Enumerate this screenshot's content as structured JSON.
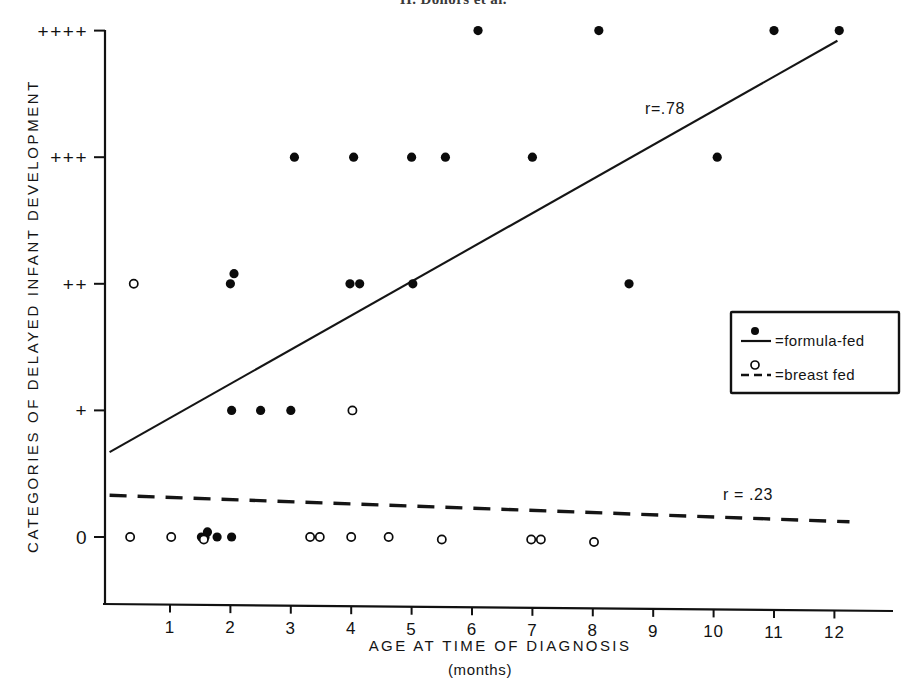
{
  "figure": {
    "caption": "H. Donors et al."
  },
  "axes": {
    "x_title": "AGE AT TIME OF DIAGNOSIS",
    "x_subtitle": "(months)",
    "y_title": "CATEGORIES OF DELAYED INFANT DEVELOPMENT"
  },
  "legend": {
    "formula_label": "=formula-fed",
    "breast_label": "=breast fed",
    "formula_marker": "filled-circle-icon",
    "breast_marker": "open-circle-icon",
    "formula_line": "solid-line-icon",
    "breast_line": "dashed-line-icon"
  },
  "annotations": {
    "r_formula": "r=.78",
    "r_breast": "r = .23"
  },
  "chart_data": {
    "type": "scatter",
    "title": "",
    "xlabel": "AGE AT TIME OF DIAGNOSIS (months)",
    "ylabel": "CATEGORIES OF DELAYED INFANT DEVELOPMENT",
    "xlim": [
      0,
      12.4
    ],
    "ylim": [
      0,
      4
    ],
    "grid": false,
    "legend_position": "right-middle",
    "xticks": [
      1,
      2,
      3,
      4,
      5,
      6,
      7,
      8,
      9,
      10,
      11,
      12
    ],
    "xticklabels": [
      "1",
      "2",
      "3",
      "4",
      "5",
      "6",
      "7",
      "8",
      "9",
      "10",
      "11",
      "12"
    ],
    "yticks": [
      0,
      1,
      2,
      3,
      4
    ],
    "yticklabels": [
      "0",
      "+",
      "++",
      "+++",
      "++++"
    ],
    "series": [
      {
        "name": "=formula-fed",
        "marker": "filled-circle",
        "points": [
          [
            1.52,
            0
          ],
          [
            1.58,
            0
          ],
          [
            1.62,
            0.04
          ],
          [
            1.78,
            0
          ],
          [
            2.02,
            0
          ],
          [
            2.02,
            1
          ],
          [
            2.5,
            1
          ],
          [
            3.0,
            1
          ],
          [
            2.0,
            2
          ],
          [
            2.06,
            2.08
          ],
          [
            3.98,
            2
          ],
          [
            4.14,
            2
          ],
          [
            5.02,
            2
          ],
          [
            8.6,
            2
          ],
          [
            3.06,
            3
          ],
          [
            4.04,
            3
          ],
          [
            5.0,
            3
          ],
          [
            5.56,
            3
          ],
          [
            7.0,
            3
          ],
          [
            10.06,
            3
          ],
          [
            6.1,
            4
          ],
          [
            8.1,
            4
          ],
          [
            11.0,
            4
          ],
          [
            12.08,
            4
          ]
        ],
        "trendline": {
          "style": "solid",
          "label": "r=.78",
          "x0": 0,
          "y0": 0.67,
          "x1": 12.05,
          "y1": 3.92
        }
      },
      {
        "name": "=breast fed",
        "marker": "open-circle",
        "points": [
          [
            0.34,
            0
          ],
          [
            1.02,
            0
          ],
          [
            1.56,
            -0.02
          ],
          [
            3.32,
            0
          ],
          [
            3.48,
            0
          ],
          [
            4.0,
            0
          ],
          [
            4.62,
            0
          ],
          [
            5.5,
            -0.02
          ],
          [
            6.98,
            -0.02
          ],
          [
            7.14,
            -0.02
          ],
          [
            8.02,
            -0.04
          ],
          [
            0.4,
            2
          ],
          [
            4.02,
            1
          ]
        ],
        "trendline": {
          "style": "dashed",
          "label": "r = .23",
          "x0": 0,
          "y0": 0.33,
          "x1": 12.25,
          "y1": 0.12
        }
      }
    ]
  }
}
